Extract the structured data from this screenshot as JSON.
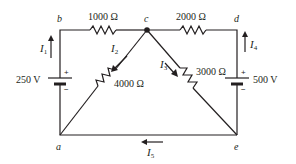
{
  "circuit": {
    "nodes": {
      "a": "a",
      "b": "b",
      "c": "c",
      "d": "d",
      "e": "e"
    },
    "resistors": {
      "r_bc": "1000 Ω",
      "r_cd": "2000 Ω",
      "r_ca": "4000 Ω",
      "r_ce": "3000 Ω"
    },
    "sources": {
      "left": {
        "value": "250 V",
        "plus": "+",
        "minus": "−"
      },
      "right": {
        "value": "500 V",
        "plus": "+",
        "minus": "−"
      }
    },
    "currents": {
      "I1": {
        "main": "I",
        "sub": "1"
      },
      "I2": {
        "main": "I",
        "sub": "2"
      },
      "I3": {
        "main": "I",
        "sub": "3"
      },
      "I4": {
        "main": "I",
        "sub": "4"
      },
      "I5": {
        "main": "I",
        "sub": "5"
      }
    },
    "colors": {
      "ink": "#231f20",
      "background": "#ffffff"
    }
  }
}
